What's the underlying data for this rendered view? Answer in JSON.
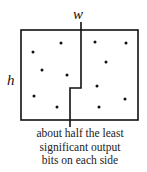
{
  "diagram": {
    "labels": {
      "width": "w",
      "height": "h"
    },
    "caption": {
      "lines": [
        "about half the least",
        "significant output",
        "bits on each side"
      ]
    },
    "box": {
      "x1": 21,
      "y1": 30,
      "x2": 138,
      "y2": 120
    },
    "divider": {
      "top_x": 81,
      "top_y": 22,
      "step_y": 88,
      "bottom_x": 70,
      "bottom_y": 127
    },
    "points": {
      "left": [
        [
          33,
          52
        ],
        [
          61,
          43
        ],
        [
          42,
          70
        ],
        [
          67,
          75
        ],
        [
          34,
          96
        ],
        [
          57,
          107
        ]
      ],
      "right": [
        [
          95,
          42
        ],
        [
          126,
          43
        ],
        [
          106,
          62
        ],
        [
          97,
          86
        ],
        [
          125,
          99
        ],
        [
          99,
          107
        ]
      ]
    },
    "colors": {
      "stroke": "#111111",
      "text": "#222222"
    }
  }
}
